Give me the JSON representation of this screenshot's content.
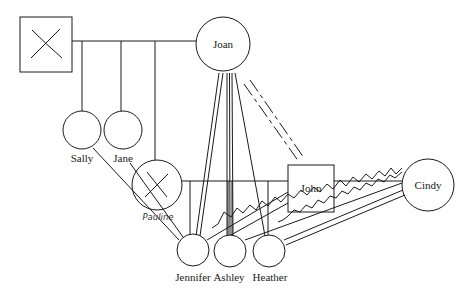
{
  "diagram": {
    "type": "genogram",
    "people": {
      "father": {
        "label": "",
        "sex": "male",
        "deceased": true
      },
      "joan": {
        "label": "Joan",
        "sex": "female"
      },
      "sally": {
        "label": "Sally",
        "sex": "female"
      },
      "jane": {
        "label": "Jane",
        "sex": "female"
      },
      "pauline": {
        "label": "Pauline",
        "sex": "female",
        "deceased": true
      },
      "john": {
        "label": "John",
        "sex": "male"
      },
      "cindy": {
        "label": "Cindy",
        "sex": "female"
      },
      "jennifer": {
        "label": "Jennifer",
        "sex": "female"
      },
      "ashley": {
        "label": "Ashley",
        "sex": "female"
      },
      "heather": {
        "label": "Heather",
        "sex": "female"
      }
    },
    "relationships": [
      {
        "from": "father",
        "to": "joan",
        "type": "marriage"
      },
      {
        "parents": [
          "father",
          "joan"
        ],
        "children": [
          "sally",
          "jane",
          "pauline"
        ]
      },
      {
        "from": "pauline",
        "to": "john",
        "type": "marriage"
      },
      {
        "from": "john",
        "to": "cindy",
        "type": "marriage"
      },
      {
        "parents": [
          "pauline",
          "john"
        ],
        "children": [
          "jennifer",
          "ashley",
          "heather"
        ]
      },
      {
        "from": "joan",
        "to": "jennifer",
        "type": "close"
      },
      {
        "from": "joan",
        "to": "ashley",
        "type": "very-close"
      },
      {
        "from": "joan",
        "to": "heather",
        "type": "connected"
      },
      {
        "from": "joan",
        "to": "john",
        "type": "distant-broken"
      },
      {
        "from": "sally",
        "to": "jennifer",
        "type": "connected"
      },
      {
        "from": "jane",
        "to": "jennifer",
        "type": "connected"
      },
      {
        "from": "john",
        "to": "ashley",
        "type": "connected"
      },
      {
        "from": "john",
        "to": "heather",
        "type": "connected"
      },
      {
        "from": "cindy",
        "to": "ashley",
        "type": "conflict"
      },
      {
        "from": "cindy",
        "to": "heather",
        "type": "conflict"
      },
      {
        "from": "cindy",
        "to": "heather",
        "type": "close"
      }
    ],
    "colors": {
      "line": "#1a1a1a",
      "background": "#ffffff"
    }
  }
}
